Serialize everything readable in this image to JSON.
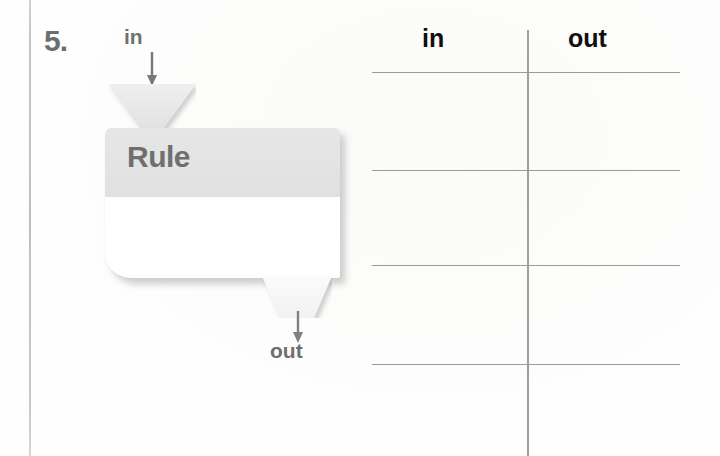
{
  "page": {
    "type": "worksheet-problem",
    "problem_number": "5.",
    "background_color": "#ffffff",
    "margin_line_color": "#bfbfbf"
  },
  "machine": {
    "input_label": "in",
    "input_arrow_icon": "arrow-down-icon",
    "input_hopper_icon": "funnel-down-icon",
    "rule_title": "Rule",
    "rule_title_color": "#6f6f6f",
    "rule_header_color": "#e3e3e3",
    "rule_body_color": "#ffffff",
    "output_hopper_icon": "funnel-down-icon",
    "output_arrow_icon": "arrow-down-icon",
    "output_label": "out"
  },
  "table": {
    "columns": [
      {
        "key": "in",
        "label": "in"
      },
      {
        "key": "out",
        "label": "out"
      }
    ],
    "rows": [
      {
        "in": "",
        "out": ""
      },
      {
        "in": "",
        "out": ""
      },
      {
        "in": "",
        "out": ""
      },
      {
        "in": "",
        "out": ""
      }
    ],
    "row_line_positions": [
      72,
      170,
      265,
      364
    ],
    "divider_color": "#9e9e9e",
    "rule_color": "#9a9a9a"
  }
}
